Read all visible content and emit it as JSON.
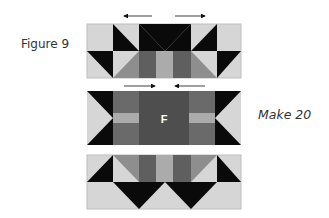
{
  "figure": {
    "label": "Figure 9",
    "instruction": "Make 20",
    "center_letter": "F"
  },
  "colors": {
    "light": "#d6d6d6",
    "black": "#0a0a0a",
    "medium": "#8e8e8e",
    "dark": "#5f5f5f",
    "center_dark": "#4e4e4e",
    "strip": "#ababab",
    "border": "#bdbdbd"
  },
  "arrows": {
    "top_row": [
      {
        "direction": "left",
        "from_x": 152,
        "to_x": 122,
        "y": 16
      },
      {
        "direction": "right",
        "from_x": 175,
        "to_x": 207,
        "y": 16
      }
    ],
    "middle_row": [
      {
        "direction": "right",
        "from_x": 124,
        "to_x": 157,
        "y": 86
      },
      {
        "direction": "left",
        "from_x": 205,
        "to_x": 173,
        "y": 86
      }
    ]
  },
  "blocks": [
    {
      "name": "top-flying-geese-row",
      "x": 87,
      "y": 24,
      "width": 154,
      "height": 54
    },
    {
      "name": "center-row",
      "x": 87,
      "y": 91,
      "width": 154,
      "height": 54
    },
    {
      "name": "bottom-flying-geese-row",
      "x": 87,
      "y": 155,
      "width": 154,
      "height": 54
    }
  ]
}
